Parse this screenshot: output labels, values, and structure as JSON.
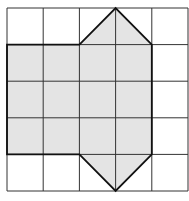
{
  "caption": "",
  "grid": {
    "cols": 5,
    "rows": 5,
    "origin_x": 7,
    "origin_y": 8,
    "cell_w": 36.2,
    "cell_h": 36.6,
    "line_color": "#333333"
  },
  "shape": {
    "fill": "#e4e4e4",
    "stroke": "#111111",
    "vertices": [
      [
        0,
        1
      ],
      [
        2,
        1
      ],
      [
        3,
        0
      ],
      [
        4,
        1
      ],
      [
        4,
        4
      ],
      [
        3,
        5
      ],
      [
        2,
        4
      ],
      [
        0,
        4
      ]
    ]
  }
}
